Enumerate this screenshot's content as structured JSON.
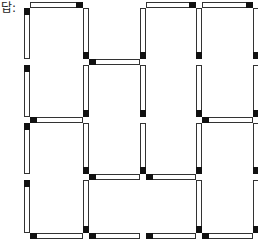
{
  "label": "답:",
  "grid": {
    "xs": [
      27,
      86,
      143,
      199,
      256
    ],
    "ys": [
      5,
      62,
      120,
      177,
      236
    ]
  },
  "horizontal_matches": [
    {
      "row": 0,
      "from": 0,
      "to": 1,
      "head": "end"
    },
    {
      "row": 0,
      "from": 2,
      "to": 3,
      "head": "end"
    },
    {
      "row": 0,
      "from": 3,
      "to": 4,
      "head": "end"
    },
    {
      "row": 1,
      "from": 1,
      "to": 2,
      "head": "start"
    },
    {
      "row": 2,
      "from": 0,
      "to": 1,
      "head": "start"
    },
    {
      "row": 2,
      "from": 3,
      "to": 4,
      "head": "start"
    },
    {
      "row": 3,
      "from": 1,
      "to": 2,
      "head": "start"
    },
    {
      "row": 3,
      "from": 2,
      "to": 3,
      "head": "start"
    },
    {
      "row": 4,
      "from": 0,
      "to": 1,
      "head": "start"
    },
    {
      "row": 4,
      "from": 1,
      "to": 2,
      "head": "start"
    },
    {
      "row": 4,
      "from": 2,
      "to": 3,
      "head": "start"
    },
    {
      "row": 4,
      "from": 3,
      "to": 4,
      "head": "start"
    }
  ],
  "vertical_matches": [
    {
      "col": 0,
      "from": 0,
      "to": 1,
      "head": "start"
    },
    {
      "col": 0,
      "from": 1,
      "to": 2,
      "head": "start"
    },
    {
      "col": 0,
      "from": 2,
      "to": 3,
      "head": "start"
    },
    {
      "col": 0,
      "from": 3,
      "to": 4,
      "head": "start"
    },
    {
      "col": 1,
      "from": 0,
      "to": 1,
      "head": "end"
    },
    {
      "col": 1,
      "from": 1,
      "to": 2,
      "head": "end"
    },
    {
      "col": 1,
      "from": 2,
      "to": 3,
      "head": "end"
    },
    {
      "col": 1,
      "from": 3,
      "to": 4,
      "head": "end"
    },
    {
      "col": 2,
      "from": 0,
      "to": 1,
      "head": "end"
    },
    {
      "col": 2,
      "from": 1,
      "to": 2,
      "head": "end"
    },
    {
      "col": 2,
      "from": 2,
      "to": 3,
      "head": "end"
    },
    {
      "col": 3,
      "from": 0,
      "to": 1,
      "head": "end"
    },
    {
      "col": 3,
      "from": 1,
      "to": 2,
      "head": "end"
    },
    {
      "col": 3,
      "from": 2,
      "to": 3,
      "head": "end"
    },
    {
      "col": 3,
      "from": 3,
      "to": 4,
      "head": "end"
    },
    {
      "col": 4,
      "from": 0,
      "to": 1,
      "head": "end"
    },
    {
      "col": 4,
      "from": 1,
      "to": 2,
      "head": "end"
    },
    {
      "col": 4,
      "from": 2,
      "to": 3,
      "head": "end"
    },
    {
      "col": 4,
      "from": 3,
      "to": 4,
      "head": "end"
    }
  ]
}
